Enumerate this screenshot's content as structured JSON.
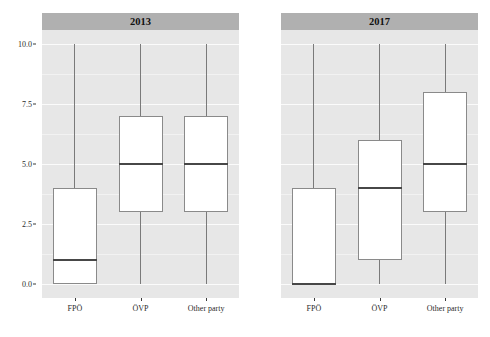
{
  "chart_data": {
    "type": "box",
    "title": "",
    "xlabel": "",
    "ylabel": "Agreement with statement",
    "ylim": [
      0,
      10
    ],
    "yticks": [
      0.0,
      2.5,
      5.0,
      7.5,
      10.0
    ],
    "ytick_labels": [
      "0.0",
      "2.5",
      "5.0",
      "7.5",
      "10.0"
    ],
    "grid": true,
    "legend": "none",
    "facet_variable": "year",
    "categories": [
      "FPÖ",
      "ÖVP",
      "Other party"
    ],
    "panels": [
      {
        "strip_label": "2013",
        "boxes": [
          {
            "category": "FPÖ",
            "whisker_low": 0,
            "q1": 0,
            "median": 1,
            "q3": 4,
            "whisker_high": 10
          },
          {
            "category": "ÖVP",
            "whisker_low": 0,
            "q1": 3,
            "median": 5,
            "q3": 7,
            "whisker_high": 10
          },
          {
            "category": "Other party",
            "whisker_low": 0,
            "q1": 3,
            "median": 5,
            "q3": 7,
            "whisker_high": 10
          }
        ]
      },
      {
        "strip_label": "2017",
        "boxes": [
          {
            "category": "FPÖ",
            "whisker_low": 0,
            "q1": 0,
            "median": 0,
            "q3": 4,
            "whisker_high": 10
          },
          {
            "category": "ÖVP",
            "whisker_low": 0,
            "q1": 1,
            "median": 4,
            "q3": 6,
            "whisker_high": 10
          },
          {
            "category": "Other party",
            "whisker_low": 0,
            "q1": 3,
            "median": 5,
            "q3": 8,
            "whisker_high": 10
          }
        ]
      }
    ],
    "colors": {
      "panel_background": "#e7e7e7",
      "strip_background": "#b0b0b0",
      "gridline_major": "#fbfbfb",
      "box_fill": "#ffffff",
      "box_border": "#8a8a8a",
      "median_line": "#474747",
      "whisker": "#7a7a7a",
      "text": "#1a1a1a"
    }
  },
  "axes": {
    "y_title": "Agreement with statement"
  }
}
